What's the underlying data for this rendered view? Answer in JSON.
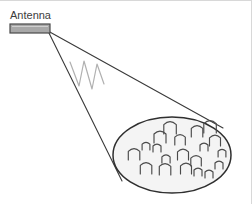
{
  "canvas": {
    "width": 252,
    "height": 204,
    "background_color": "#ffffff",
    "border_color": "#d8d8d8"
  },
  "labels": {
    "antenna": "Antenna"
  },
  "colors": {
    "antenna_fill": "#a8a8a8",
    "antenna_stroke": "#4a4a4a",
    "beam_stroke": "#3a3a3a",
    "wave_stroke": "#b0b0b0",
    "footprint_fill": "#f4f4f4",
    "footprint_stroke": "#2f2f2f",
    "person_stroke": "#4a4a4a",
    "text": "#3d3d3d"
  },
  "diagram": {
    "type": "antenna-coverage-footprint",
    "antenna_bar": {
      "x": 10,
      "y": 24,
      "width": 40,
      "height": 9
    },
    "antenna_label_pos": {
      "x": 10,
      "y": 21
    },
    "beam_origin": {
      "x": 48,
      "y": 31
    },
    "beam_upper_end": {
      "x": 223,
      "y": 128
    },
    "beam_lower_end": {
      "x": 122,
      "y": 181
    },
    "wave_path": "M 70 62 L 79 86 L 84 61 L 92 89 L 97 64 L 104 84",
    "footprint": {
      "cx": 172,
      "cy": 155,
      "rx": 59,
      "ry": 38
    },
    "people": [
      {
        "x": 134,
        "y": 160,
        "s": 1.15
      },
      {
        "x": 146,
        "y": 150,
        "s": 0.78
      },
      {
        "x": 157,
        "y": 152,
        "s": 0.8
      },
      {
        "x": 160,
        "y": 143,
        "s": 1.2
      },
      {
        "x": 170,
        "y": 134,
        "s": 1.25
      },
      {
        "x": 180,
        "y": 145,
        "s": 1.05
      },
      {
        "x": 197,
        "y": 137,
        "s": 1.15
      },
      {
        "x": 210,
        "y": 133,
        "s": 1.25
      },
      {
        "x": 215,
        "y": 146,
        "s": 1.1
      },
      {
        "x": 204,
        "y": 151,
        "s": 0.8
      },
      {
        "x": 222,
        "y": 157,
        "s": 0.78
      },
      {
        "x": 183,
        "y": 160,
        "s": 1.1
      },
      {
        "x": 166,
        "y": 163,
        "s": 0.82
      },
      {
        "x": 196,
        "y": 166,
        "s": 1.05
      },
      {
        "x": 219,
        "y": 169,
        "s": 0.8
      },
      {
        "x": 146,
        "y": 174,
        "s": 1.15
      },
      {
        "x": 165,
        "y": 175,
        "s": 1.15
      },
      {
        "x": 186,
        "y": 174,
        "s": 1.1
      },
      {
        "x": 198,
        "y": 176,
        "s": 0.8
      },
      {
        "x": 209,
        "y": 178,
        "s": 0.8
      }
    ]
  }
}
